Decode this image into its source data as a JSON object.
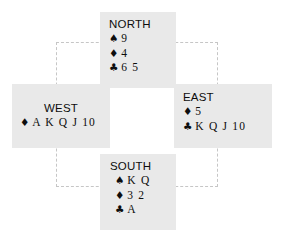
{
  "diagram": {
    "type": "bridge-hand-diagram",
    "colors": {
      "hand_background": "#e9e9e9",
      "page_background": "#ffffff",
      "dashed_border": "#c6c6c6",
      "text": "#0d0d0d"
    },
    "suit_symbols": {
      "spade": "♠",
      "heart": "♥",
      "diamond": "♦",
      "club": "♣"
    },
    "hands": {
      "north": {
        "label": "NORTH",
        "spades": "9",
        "diamonds": "4",
        "clubs": "6 5"
      },
      "west": {
        "label": "WEST",
        "diamonds": "A K Q J 10"
      },
      "east": {
        "label": "EAST",
        "diamonds": "5",
        "clubs": "K Q J 10"
      },
      "south": {
        "label": "SOUTH",
        "spades": "K Q",
        "diamonds": "3 2",
        "clubs": "A"
      }
    }
  }
}
